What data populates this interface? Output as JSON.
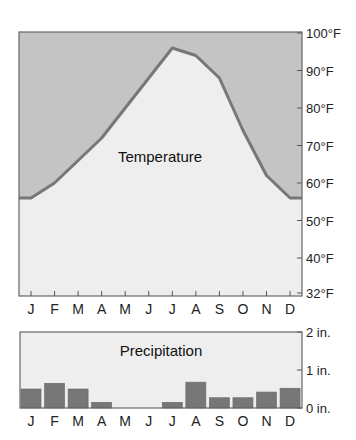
{
  "chart_data": [
    {
      "type": "area",
      "title": "Temperature",
      "xlabel": "",
      "ylabel": "",
      "categories": [
        "J",
        "F",
        "M",
        "A",
        "M",
        "J",
        "J",
        "A",
        "S",
        "O",
        "N",
        "D"
      ],
      "series": [
        {
          "name": "Temperature (°F)",
          "values": [
            56,
            60,
            66,
            72,
            80,
            88,
            96,
            94,
            88,
            74,
            62,
            56
          ]
        }
      ],
      "ylim": [
        32,
        100
      ],
      "yticks": [
        32,
        40,
        50,
        60,
        70,
        80,
        90,
        100
      ],
      "ytick_labels": [
        "32°F",
        "40°F",
        "50°F",
        "60°F",
        "70°F",
        "80°F",
        "90°F",
        "100°F"
      ],
      "axis_side": "right",
      "grid": false,
      "colors": {
        "above": "#c4c4c4",
        "below": "#eeeeee",
        "line": "#777777"
      }
    },
    {
      "type": "bar",
      "title": "Precipitation",
      "xlabel": "",
      "ylabel": "",
      "categories": [
        "J",
        "F",
        "M",
        "A",
        "M",
        "J",
        "J",
        "A",
        "S",
        "O",
        "N",
        "D"
      ],
      "series": [
        {
          "name": "Precipitation (in.)",
          "values": [
            0.5,
            0.65,
            0.5,
            0.15,
            0,
            0,
            0.15,
            0.68,
            0.27,
            0.27,
            0.42,
            0.52
          ]
        }
      ],
      "ylim": [
        0,
        2
      ],
      "yticks": [
        0,
        1,
        2
      ],
      "ytick_labels": [
        "0 in.",
        "1 in.",
        "2 in."
      ],
      "axis_side": "right",
      "grid": false,
      "colors": {
        "background": "#eeeeee",
        "bar": "#777777"
      }
    }
  ]
}
